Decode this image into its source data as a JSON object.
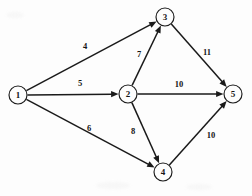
{
  "figure": {
    "kind": "directed-weighted-network-diagram",
    "background_color": "#fdfdfd",
    "ink_color": "#1a1a1a",
    "width": 252,
    "height": 196
  },
  "chart_data": {
    "type": "diagram",
    "title": "",
    "xlabel": "",
    "ylabel": "",
    "directed": true,
    "node_radius": 9,
    "nodes": [
      {
        "id": "1",
        "label": "1",
        "x": 18,
        "y": 95
      },
      {
        "id": "2",
        "label": "2",
        "x": 128,
        "y": 94
      },
      {
        "id": "3",
        "label": "3",
        "x": 165,
        "y": 17
      },
      {
        "id": "4",
        "label": "4",
        "x": 163,
        "y": 172
      },
      {
        "id": "5",
        "label": "5",
        "x": 233,
        "y": 94
      }
    ],
    "edges": [
      {
        "from": "1",
        "to": "3",
        "weight": "4",
        "label_x": 85,
        "label_y": 46
      },
      {
        "from": "1",
        "to": "2",
        "weight": "5",
        "label_x": 80,
        "label_y": 83
      },
      {
        "from": "1",
        "to": "4",
        "weight": "6",
        "label_x": 89,
        "label_y": 128
      },
      {
        "from": "2",
        "to": "3",
        "weight": "7",
        "label_x": 139,
        "label_y": 54
      },
      {
        "from": "2",
        "to": "5",
        "weight": "10",
        "label_x": 179,
        "label_y": 84
      },
      {
        "from": "2",
        "to": "4",
        "weight": "8",
        "label_x": 133,
        "label_y": 131
      },
      {
        "from": "3",
        "to": "5",
        "weight": "11",
        "label_x": 207,
        "label_y": 52
      },
      {
        "from": "4",
        "to": "5",
        "weight": "10",
        "label_x": 211,
        "label_y": 135
      }
    ]
  }
}
